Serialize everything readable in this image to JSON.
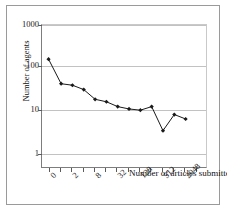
{
  "figure": {
    "background": "#ffffff",
    "frame_color": "#9a9a9a",
    "series_color": "#1a1a1a",
    "grid_color": "#c2c2c2"
  },
  "axes": {
    "y_title": "Number of agents",
    "x_title": "Number of articles submitted",
    "y_tick_labels": [
      "1000",
      "100",
      "10",
      "1"
    ],
    "x_tick_labels": [
      "0",
      "2",
      "8",
      "32",
      "128",
      "512",
      "2048"
    ]
  },
  "chart_data": {
    "type": "line",
    "title": "",
    "xlabel": "Number of articles submitted",
    "ylabel": "Number of agents",
    "xscale": "log2",
    "yscale": "log10",
    "ylim": [
      1,
      1000
    ],
    "y_ticks": [
      1,
      10,
      100,
      1000
    ],
    "x_ticks_labeled": [
      0,
      2,
      8,
      32,
      128,
      512,
      2048
    ],
    "grid": true,
    "legend": "none",
    "marker": "filled-diamond",
    "x": [
      1,
      2,
      4,
      8,
      16,
      32,
      64,
      128,
      256,
      512,
      1024,
      2048,
      4096
    ],
    "x_index": [
      0,
      1,
      2,
      3,
      4,
      5,
      6,
      7,
      8,
      9,
      10,
      11,
      12,
      13
    ],
    "values": [
      185,
      57,
      53,
      43,
      27,
      24,
      19,
      17,
      16,
      19,
      6,
      13,
      10.5
    ],
    "series": [
      {
        "name": "agents",
        "points": [
          {
            "xi": 0.6,
            "y": 185
          },
          {
            "xi": 1.6,
            "y": 57
          },
          {
            "xi": 2.5,
            "y": 53
          },
          {
            "xi": 3.4,
            "y": 43
          },
          {
            "xi": 4.3,
            "y": 27
          },
          {
            "xi": 5.2,
            "y": 24
          },
          {
            "xi": 6.1,
            "y": 19
          },
          {
            "xi": 7.0,
            "y": 17
          },
          {
            "xi": 7.9,
            "y": 16
          },
          {
            "xi": 8.8,
            "y": 19
          },
          {
            "xi": 9.7,
            "y": 6
          },
          {
            "xi": 10.6,
            "y": 13
          },
          {
            "xi": 11.5,
            "y": 10.5
          }
        ]
      }
    ]
  }
}
